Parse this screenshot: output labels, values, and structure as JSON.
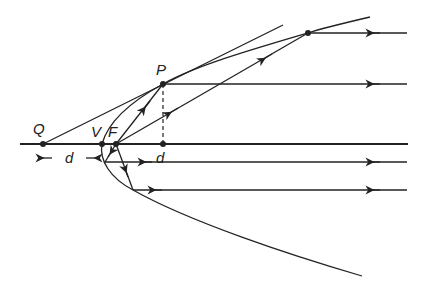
{
  "diagram": {
    "labels": {
      "P": "P",
      "Q": "Q",
      "V": "V",
      "F": "F",
      "d_left": "d",
      "d_right": "d"
    },
    "points": {
      "Q": [
        43,
        144
      ],
      "V": [
        102,
        144
      ],
      "F": [
        116,
        144
      ],
      "P": [
        163,
        84
      ],
      "P_foot": [
        163,
        144
      ],
      "R": [
        308,
        33
      ]
    },
    "colors": {
      "line": "#222222",
      "background": "#ffffff"
    }
  }
}
